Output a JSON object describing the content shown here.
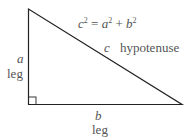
{
  "diagram": {
    "formula": {
      "c": "c",
      "eq": " = ",
      "a": "a",
      "plus": " + ",
      "b": "b",
      "exp": "2"
    },
    "labels": {
      "side_a": "a",
      "side_a_name": "leg",
      "side_b": "b",
      "side_b_name": "leg",
      "side_c": "c",
      "side_c_name": "hypotenuse"
    },
    "colors": {
      "line": "#222222",
      "text": "#555555"
    }
  }
}
